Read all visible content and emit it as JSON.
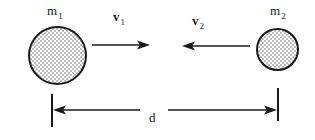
{
  "figure": {
    "type": "physics-collision-diagram",
    "width": 315,
    "height": 140,
    "background_color": "#ffffff",
    "ink_color": "#1a1a1a",
    "fill_color": "#c9c9c9"
  },
  "bodies": [
    {
      "id": "mass-1",
      "symbol": "m",
      "subscript": "1",
      "cx": 57.5,
      "cy": 55.5,
      "r": 28.5,
      "label_x": 47,
      "label_y": 4
    },
    {
      "id": "mass-2",
      "symbol": "m",
      "subscript": "2",
      "cx": 277.5,
      "cy": 49.5,
      "r": 20.5,
      "label_x": 270,
      "label_y": 4
    }
  ],
  "vectors": [
    {
      "id": "velocity-1",
      "symbol": "v",
      "subscript": "1",
      "direction": "right",
      "x1": 92,
      "x2": 150,
      "y": 45,
      "label_x": 113,
      "label_y": 10
    },
    {
      "id": "velocity-2",
      "symbol": "v",
      "subscript": "2",
      "direction": "left",
      "x1": 250,
      "x2": 182,
      "y": 46,
      "label_x": 192,
      "label_y": 14
    }
  ],
  "dimension": {
    "id": "separation-distance",
    "symbol": "d",
    "label_x": 149,
    "label_y": 111,
    "axis_y": 110,
    "left_tick_x": 52,
    "left_tick_y1": 94,
    "left_tick_y2": 127,
    "right_tick_x": 278,
    "right_tick_y1": 88,
    "right_tick_y2": 121,
    "left_segment_x2": 140,
    "right_segment_x1": 168
  }
}
